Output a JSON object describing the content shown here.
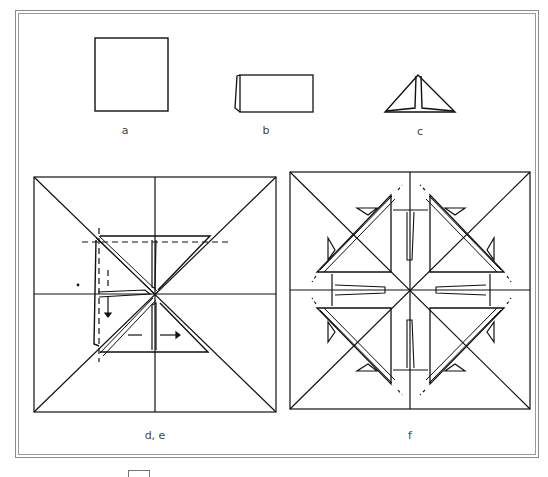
{
  "figure": {
    "panels": [
      {
        "id": "a",
        "label": "a",
        "description": "Square sheet"
      },
      {
        "id": "b",
        "label": "b",
        "description": "Sheet folded in half"
      },
      {
        "id": "c",
        "label": "c",
        "description": "Triangle fold"
      },
      {
        "id": "de",
        "label": "d, e",
        "description": "Square with diagonals showing folded units at center with dashed guide lines and arrows"
      },
      {
        "id": "f",
        "label": "f",
        "description": "Completed square with eight triangular units arranged around center"
      }
    ]
  },
  "colors": {
    "line": "#111111",
    "frame": "#8a8a8a",
    "label": "#444444",
    "background": "#ffffff"
  }
}
